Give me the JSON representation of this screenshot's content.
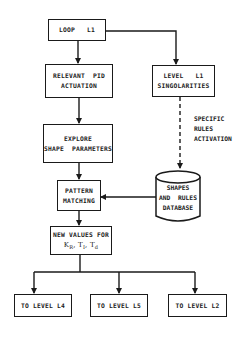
{
  "diagram": {
    "type": "flowchart",
    "nodes": {
      "loop": {
        "label": "LOOP   L1"
      },
      "pid": {
        "line1": "RELEVANT  PID",
        "line2": "ACTUATION"
      },
      "level": {
        "line1": "LEVEL   L1",
        "line2": "SINGOLARITIES"
      },
      "explore": {
        "line1": "EXPLORE",
        "line2": "SHAPE  PARAMETERS"
      },
      "pattern": {
        "line1": "PATTERN",
        "line2": "MATCHING"
      },
      "database": {
        "line1": "SHAPES",
        "line2": "AND  RULES",
        "line3": "DATABASE"
      },
      "newvalues": {
        "line1": "NEW VALUES FOR",
        "k": "K",
        "k_sub": "R",
        "ti": "T",
        "ti_sub": "I",
        "td": "T",
        "td_sub": "d",
        "sep": ", "
      },
      "l4": {
        "label": "TO LEVEL L4"
      },
      "l5": {
        "label": "TO LEVEL L5"
      },
      "l2": {
        "label": "TO LEVEL L2"
      }
    },
    "annotations": {
      "dashed_edge": {
        "line1": "SPECIFIC",
        "line2": "RULES",
        "line3": "ACTIVATION"
      }
    },
    "edges": [
      {
        "from": "LOOP L1",
        "to": "RELEVANT PID ACTUATION",
        "style": "solid"
      },
      {
        "from": "LOOP L1",
        "to": "LEVEL L1 SINGOLARITIES",
        "style": "solid"
      },
      {
        "from": "RELEVANT PID ACTUATION",
        "to": "EXPLORE SHAPE PARAMETERS",
        "style": "solid"
      },
      {
        "from": "EXPLORE SHAPE PARAMETERS",
        "to": "PATTERN MATCHING",
        "style": "solid"
      },
      {
        "from": "LEVEL L1 SINGOLARITIES",
        "to": "SHAPES AND RULES DATABASE",
        "style": "dashed",
        "label": "SPECIFIC RULES ACTIVATION"
      },
      {
        "from": "SHAPES AND RULES DATABASE",
        "to": "PATTERN MATCHING",
        "style": "solid"
      },
      {
        "from": "PATTERN MATCHING",
        "to": "NEW VALUES FOR KR, TI, Td",
        "style": "solid"
      },
      {
        "from": "NEW VALUES FOR KR, TI, Td",
        "to": "TO LEVEL L4",
        "style": "solid"
      },
      {
        "from": "NEW VALUES FOR KR, TI, Td",
        "to": "TO LEVEL L5",
        "style": "solid"
      },
      {
        "from": "NEW VALUES FOR KR, TI, Td",
        "to": "TO LEVEL L2",
        "style": "solid"
      }
    ],
    "colors": {
      "ink": "#1a1a1a",
      "background": "#ffffff"
    }
  }
}
